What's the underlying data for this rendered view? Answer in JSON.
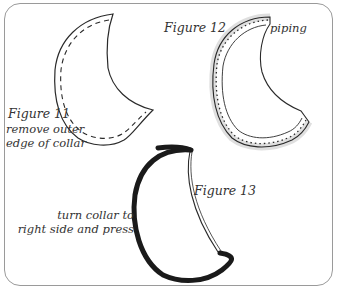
{
  "figures": [
    {
      "id": "figure-11",
      "title": "Figure 11",
      "caption_lines": [
        "remove outer",
        "edge of collar"
      ],
      "style": "collar outline with dashed seam line"
    },
    {
      "id": "figure-12",
      "title": "Figure 12",
      "callout": "piping",
      "style": "collar outline with piping along outer edge"
    },
    {
      "id": "figure-13",
      "title": "Figure 13",
      "caption_lines": [
        "turn collar to",
        "right side and press"
      ],
      "style": "collar turned right side out, heavy outer edge"
    }
  ],
  "colors": {
    "line": "#2a2a2a",
    "frame": "#9a9a9a",
    "text": "#333333"
  }
}
